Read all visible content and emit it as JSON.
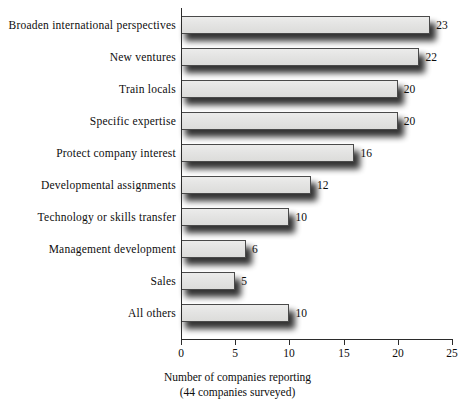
{
  "chart_data": {
    "type": "bar",
    "orientation": "horizontal",
    "title": "",
    "categories": [
      "Broaden international perspectives",
      "New ventures",
      "Train locals",
      "Specific expertise",
      "Protect company interest",
      "Developmental assignments",
      "Technology or skills transfer",
      "Management development",
      "Sales",
      "All others"
    ],
    "values": [
      23,
      22,
      20,
      20,
      16,
      12,
      10,
      6,
      5,
      10
    ],
    "data_labels": [
      "23",
      "22",
      "20",
      "20",
      "16",
      "12",
      "10",
      "6",
      "5",
      "10"
    ],
    "xlabel_line1": "Number of companies reporting",
    "xlabel_line2": "(44 companies surveyed)",
    "ylabel": "",
    "xlim": [
      0,
      25
    ],
    "xticks": [
      0,
      5,
      10,
      15,
      20,
      25
    ],
    "xtick_labels": [
      "0",
      "5",
      "10",
      "15",
      "20",
      "25"
    ],
    "grid": false,
    "legend": false,
    "bar_fill_color": "#e4e4e3",
    "bar_border_color": "#4a4a4a",
    "shadow_color": "#000000",
    "axis_color": "#2b2b2b",
    "text_color": "#0d0d0d",
    "background_color": "#ffffff"
  },
  "layout": {
    "plot_left_px": 181,
    "plot_right_px": 452,
    "first_bar_top_px": 16,
    "bar_height_px": 18,
    "bar_pitch_px": 32,
    "axis_y_px": 339
  }
}
